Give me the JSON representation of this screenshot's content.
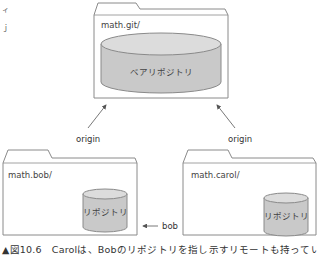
{
  "diagram": {
    "colors": {
      "folder_stroke": "#8a8a8a",
      "cylinder_fill": "#c9c9c9",
      "cylinder_top": "#dcdcdc",
      "cylinder_stroke": "#8a8a8a",
      "arrow": "#555555"
    },
    "shared_folder": {
      "label": "math.git/",
      "repository_label": "ベアリポジトリ"
    },
    "bob_folder": {
      "label": "math.bob/",
      "repository_label": "リポジトリ"
    },
    "carol_folder": {
      "label": "math.carol/",
      "repository_label": "リポジトリ"
    },
    "arrows": {
      "bob_origin": "origin",
      "carol_origin": "origin",
      "bob_remote": "bob"
    },
    "edge_marks": [
      "ィ",
      "ｊ"
    ],
    "caption": "▲図10.6　Carolは、Bobのリポジトリを指し示すリモートも持っている"
  }
}
